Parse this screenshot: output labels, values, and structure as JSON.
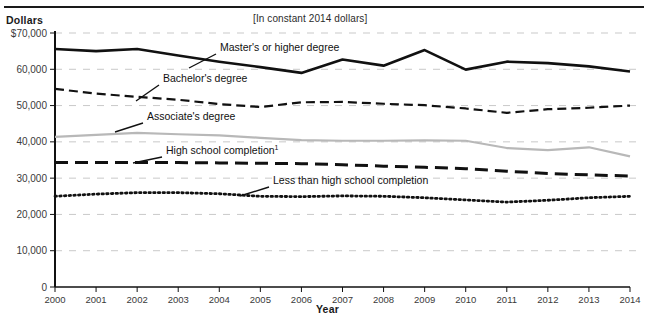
{
  "figure": {
    "cut_title": "",
    "subtitle": "[In constant 2014 dollars]",
    "y_axis_title": "Dollars",
    "x_axis_title": "Year"
  },
  "annotations": [
    {
      "name": "masters-label",
      "text": "Master's or higher degree"
    },
    {
      "name": "bachelors-label",
      "text": "Bachelor's degree"
    },
    {
      "name": "associates-label",
      "text": "Associate's degree"
    },
    {
      "name": "highschool-label",
      "text": "High school completion",
      "footnote": "1"
    },
    {
      "name": "lessthanhs-label",
      "text": "Less than high school completion"
    }
  ],
  "colors": {
    "masters": "#111111",
    "bachelors": "#111111",
    "associates": "#b8b8b8",
    "high_school": "#111111",
    "less_than_hs": "#111111",
    "gridline": "#c9c9c9",
    "axis": "#111111"
  },
  "chart_data": {
    "type": "line",
    "title": "",
    "subtitle": "[In constant 2014 dollars]",
    "xlabel": "Year",
    "ylabel": "Dollars",
    "x": [
      2000,
      2001,
      2002,
      2003,
      2004,
      2005,
      2006,
      2007,
      2008,
      2009,
      2010,
      2011,
      2012,
      2013,
      2014
    ],
    "categories": [
      "2000",
      "2001",
      "2002",
      "2003",
      "2004",
      "2005",
      "2006",
      "2007",
      "2008",
      "2009",
      "2010",
      "2011",
      "2012",
      "2013",
      "2014"
    ],
    "ylim": [
      0,
      70000
    ],
    "yticks": [
      0,
      10000,
      20000,
      30000,
      40000,
      50000,
      60000,
      70000
    ],
    "ytick_labels": [
      "0",
      "10,000",
      "20,000",
      "30,000",
      "40,000",
      "50,000",
      "60,000",
      "$70,000"
    ],
    "grid": true,
    "legend": "inline-annotations",
    "series": [
      {
        "name": "Master's or higher degree",
        "style": "solid",
        "color": "#111111",
        "values": [
          65600,
          65000,
          65600,
          63800,
          62100,
          60600,
          59000,
          62700,
          61000,
          65300,
          59900,
          62100,
          61700,
          60800,
          59400
        ]
      },
      {
        "name": "Bachelor's degree",
        "style": "dashed",
        "color": "#111111",
        "values": [
          54600,
          53300,
          52400,
          51600,
          50400,
          49600,
          50900,
          51000,
          50500,
          50100,
          49200,
          48000,
          49000,
          49400,
          50000
        ]
      },
      {
        "name": "Associate's degree",
        "style": "solid-light",
        "color": "#b8b8b8",
        "values": [
          41400,
          41900,
          42500,
          42100,
          41800,
          41100,
          40500,
          40300,
          40300,
          40400,
          40300,
          38300,
          37700,
          38500,
          36000
        ]
      },
      {
        "name": "High school completion",
        "footnote": "1",
        "style": "long-dash",
        "color": "#111111",
        "values": [
          34300,
          34300,
          34300,
          34300,
          34200,
          34100,
          34000,
          33700,
          33300,
          33000,
          32600,
          31900,
          31300,
          30900,
          30600
        ]
      },
      {
        "name": "Less than high school completion",
        "style": "dotted",
        "color": "#111111",
        "values": [
          25000,
          25600,
          26000,
          26000,
          25700,
          25000,
          24900,
          25100,
          25000,
          24600,
          24000,
          23400,
          23900,
          24600,
          25000
        ]
      }
    ]
  }
}
